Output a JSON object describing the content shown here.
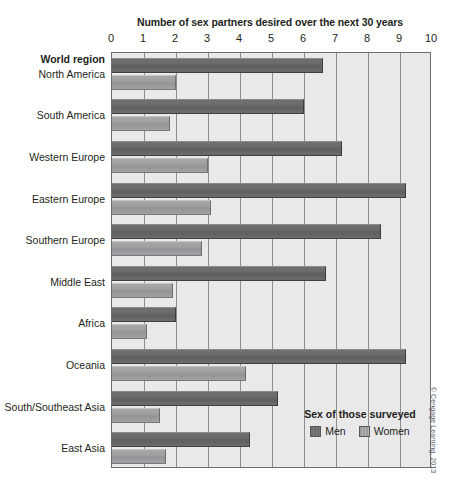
{
  "axis": {
    "title": "Number of sex partners desired over the next 30 years",
    "ticks": [
      "0",
      "1",
      "2",
      "3",
      "4",
      "5",
      "6",
      "7",
      "8",
      "9",
      "10"
    ]
  },
  "category_axis": {
    "header": "World region"
  },
  "legend": {
    "title": "Sex of those surveyed",
    "items": [
      {
        "label": "Men",
        "color": "#6a6b6d"
      },
      {
        "label": "Women",
        "color": "#9fa0a2"
      }
    ]
  },
  "credit": "© Cengage Learning, 2013",
  "chart_data": {
    "type": "bar",
    "orientation": "horizontal",
    "title": "Number of sex partners desired over the next 30 years",
    "xlabel": "Number of sex partners desired over the next 30 years",
    "ylabel": "World region",
    "xlim": [
      0,
      10
    ],
    "xticks": [
      0,
      1,
      2,
      3,
      4,
      5,
      6,
      7,
      8,
      9,
      10
    ],
    "grid": true,
    "legend_position": "inside-bottom-right",
    "categories": [
      "North America",
      "South America",
      "Western Europe",
      "Eastern Europe",
      "Southern Europe",
      "Middle East",
      "Africa",
      "Oceania",
      "South/Southeast Asia",
      "East Asia"
    ],
    "series": [
      {
        "name": "Men",
        "color": "#6a6b6d",
        "values": [
          6.6,
          6.0,
          7.2,
          9.2,
          8.4,
          6.7,
          2.0,
          9.2,
          5.2,
          4.3
        ]
      },
      {
        "name": "Women",
        "color": "#9fa0a2",
        "values": [
          2.0,
          1.8,
          3.0,
          3.1,
          2.8,
          1.9,
          1.1,
          4.2,
          1.5,
          1.7
        ]
      }
    ]
  }
}
